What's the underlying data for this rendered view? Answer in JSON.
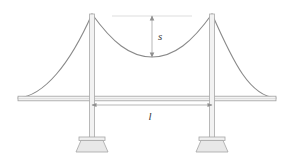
{
  "figure": {
    "name": "suspension-bridge-diagram",
    "background_color": "#ffffff"
  },
  "colors": {
    "cable": "#8a8a8a",
    "tower": "#a8a8a8",
    "tower_fill": "#f2f2f2",
    "deck_stroke": "#a0a0a0",
    "deck_fill": "#f4f4f4",
    "foundation_stroke": "#a5a5a5",
    "foundation_fill": "#e8e8e8",
    "foundation_cap_fill": "#f0f0f0",
    "dimension_line": "#9a9a9a",
    "reference_line": "#cccccc",
    "label_text": "#3a3a3a"
  },
  "labels": {
    "sag": {
      "text": "s",
      "meaning": "cable-sag",
      "x": 158,
      "y": 40
    },
    "span": {
      "text": "l",
      "meaning": "main-span-length",
      "x": 150,
      "y": 117
    }
  },
  "geometry": {
    "canvas": {
      "width": 292,
      "height": 160
    },
    "towers": [
      {
        "id": "left-tower",
        "x": 92,
        "top_y": 14,
        "bottom_y": 139,
        "width": 5
      },
      {
        "id": "right-tower",
        "x": 212,
        "top_y": 14,
        "bottom_y": 139,
        "width": 5
      }
    ],
    "deck": {
      "left_x": 18,
      "right_x": 276,
      "top_y": 96,
      "bottom_y": 101
    },
    "main_cable": {
      "left_anchor": {
        "x": 18,
        "y": 98
      },
      "left_tower_top": {
        "x": 92,
        "y": 14
      },
      "mid_low_point": {
        "x": 152,
        "y": 57
      },
      "right_tower_top": {
        "x": 212,
        "y": 14
      },
      "right_anchor": {
        "x": 276,
        "y": 98
      }
    },
    "foundations": [
      {
        "id": "left-foundation",
        "center_x": 92,
        "top_y": 138,
        "bottom_y": 152,
        "top_width": 24,
        "bottom_width": 34
      },
      {
        "id": "right-foundation",
        "center_x": 212,
        "top_y": 138,
        "bottom_y": 152,
        "top_width": 24,
        "bottom_width": 34
      }
    ],
    "sag_dimension": {
      "x": 152,
      "top_y": 16,
      "bottom_y": 57
    },
    "span_dimension": {
      "y": 105,
      "left_x": 92,
      "right_x": 212
    },
    "reference_line": {
      "y": 16,
      "left_x": 112,
      "right_x": 192
    }
  }
}
